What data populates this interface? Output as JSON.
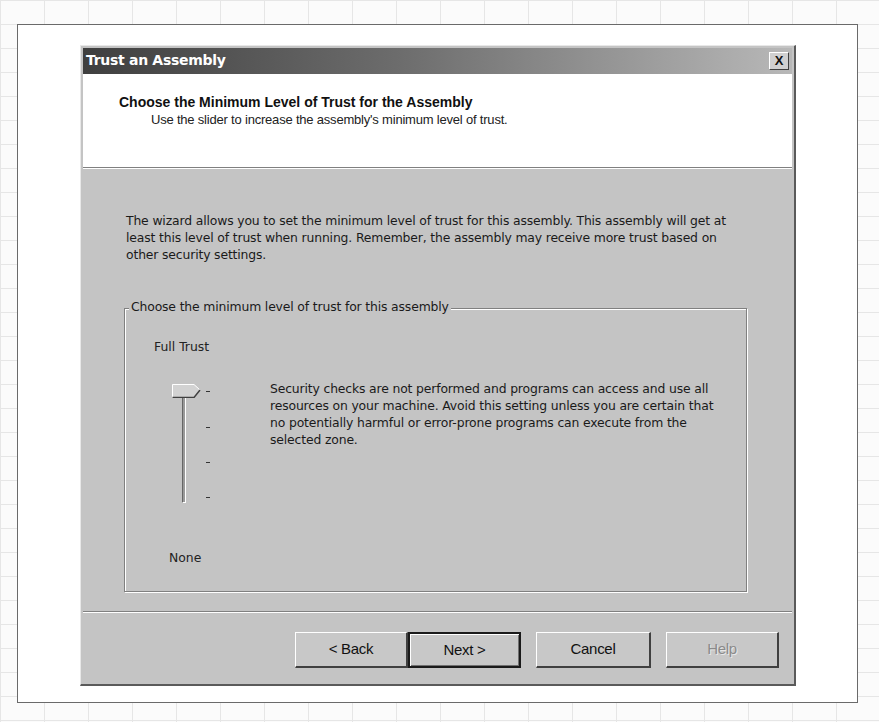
{
  "window": {
    "title": "Trust an Assembly",
    "close_label": "X"
  },
  "header": {
    "title": "Choose the Minimum Level of Trust for the Assembly",
    "subtitle": "Use the slider to increase the assembly's minimum level of trust."
  },
  "intro": {
    "text": "The wizard allows you to set the minimum level of trust for this assembly.  This assembly will get at least this level of trust when running.  Remember, the assembly may receive more trust based on other security settings."
  },
  "trust_group": {
    "legend": "Choose the minimum level of trust for this assembly",
    "slider": {
      "top_label": "Full Trust",
      "bottom_label": "None",
      "current_value": "Full Trust",
      "tick_count": 4
    },
    "description": "Security checks are not performed and programs can access and use all resources on your machine.  Avoid this setting unless you are certain that no potentially harmful or error-prone programs can execute from the selected zone."
  },
  "buttons": {
    "back": "< Back",
    "next": "Next >",
    "cancel": "Cancel",
    "help": "Help"
  },
  "icons": {
    "close": "close-icon"
  }
}
